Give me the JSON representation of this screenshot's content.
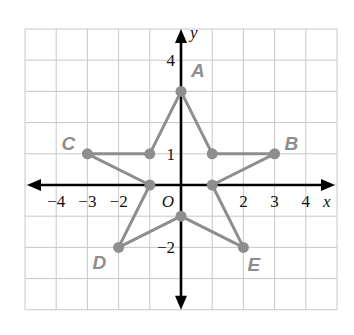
{
  "chart_data": {
    "type": "scatter",
    "title": "",
    "xlabel": "x",
    "ylabel": "y",
    "origin_label": "O",
    "xlim": [
      -5,
      5
    ],
    "ylim": [
      -4,
      5
    ],
    "grid": true,
    "x_ticks": [
      {
        "value": -4,
        "label": "−4"
      },
      {
        "value": -3,
        "label": "−3"
      },
      {
        "value": -2,
        "label": "−2"
      },
      {
        "value": 2,
        "label": "2"
      },
      {
        "value": 3,
        "label": "3"
      },
      {
        "value": 4,
        "label": "4"
      }
    ],
    "y_ticks": [
      {
        "value": 4,
        "label": "4"
      },
      {
        "value": 1,
        "label": "1"
      },
      {
        "value": -2,
        "label": "−2"
      }
    ],
    "labeled_points": [
      {
        "name": "A",
        "x": 0,
        "y": 3
      },
      {
        "name": "B",
        "x": 3,
        "y": 1
      },
      {
        "name": "C",
        "x": -3,
        "y": 1
      },
      {
        "name": "D",
        "x": -2,
        "y": -2
      },
      {
        "name": "E",
        "x": 2,
        "y": -2
      }
    ],
    "star_polygon": [
      {
        "x": 0,
        "y": 3
      },
      {
        "x": 1,
        "y": 1
      },
      {
        "x": 3,
        "y": 1
      },
      {
        "x": 1,
        "y": 0
      },
      {
        "x": 2,
        "y": -2
      },
      {
        "x": 0,
        "y": -1
      },
      {
        "x": -2,
        "y": -2
      },
      {
        "x": -1,
        "y": 0
      },
      {
        "x": -3,
        "y": 1
      },
      {
        "x": -1,
        "y": 1
      }
    ],
    "colors": {
      "polygon": "#8e8e8e",
      "grid": "#c8c8c8",
      "axes": "#000000"
    }
  }
}
